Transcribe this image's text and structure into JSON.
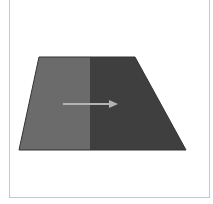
{
  "diagram": {
    "colors": {
      "background": "#ffffff",
      "frame_border": "#c8c8c8",
      "left_region": "#6b6b6b",
      "right_region": "#3f3f3f",
      "arrow": "#b4b4b4"
    },
    "shape": {
      "type": "trapezoid",
      "top_left": [
        39,
        57
      ],
      "top_right": [
        135,
        57
      ],
      "bottom_right": [
        186,
        150
      ],
      "bottom_left": [
        19,
        150
      ],
      "split_x": 90
    },
    "arrow": {
      "direction": "right",
      "from": [
        63,
        104
      ],
      "to": [
        118,
        104
      ]
    }
  }
}
